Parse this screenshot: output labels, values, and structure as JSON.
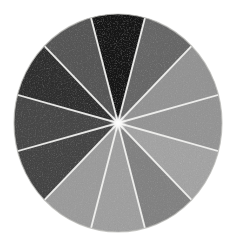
{
  "figure": {
    "background_color": "#ffffff",
    "separator_color": "#f2f2f0",
    "outline_color": "#b9b9b6",
    "texture": "hand-painted grainy gouache"
  },
  "chart_data": {
    "type": "pie",
    "xlabel": "",
    "ylabel": "",
    "legend_position": "none",
    "grid": false,
    "center_x": 118,
    "center_y": 123,
    "radius_x": 104,
    "radius_y": 109,
    "slice_count": 12,
    "equal_slices": true,
    "slice_angle_degrees": 30,
    "start_angle_degrees": -15,
    "categories": [
      "wedge-01",
      "wedge-02",
      "wedge-03",
      "wedge-04",
      "wedge-05",
      "wedge-06",
      "wedge-07",
      "wedge-08",
      "wedge-09",
      "wedge-10",
      "wedge-11",
      "wedge-12"
    ],
    "values": [
      8.3333,
      8.3333,
      8.3333,
      8.3333,
      8.3333,
      8.3333,
      8.3333,
      8.3333,
      8.3333,
      8.3333,
      8.3333,
      8.3333
    ],
    "colors": [
      "#0b0b0b",
      "#6e6e6e",
      "#8d8d8d",
      "#9a9a9a",
      "#9e9e9e",
      "#8a8a8a",
      "#9c9c9c",
      "#a4a4a4",
      "#3a3a3a",
      "#4a4a4a",
      "#242424",
      "#5c5c5c"
    ],
    "gray_levels": [
      11,
      110,
      141,
      154,
      158,
      138,
      156,
      164,
      58,
      74,
      36,
      92
    ],
    "ylim": [
      0,
      100
    ]
  },
  "slices": [
    {
      "name": "wedge-01",
      "position": "top",
      "start_angle": -15,
      "end_angle": 15,
      "color": "#0b0b0b",
      "gray": 11,
      "label": "black"
    },
    {
      "name": "wedge-02",
      "position": "upper-right-1",
      "start_angle": 15,
      "end_angle": 45,
      "color": "#6e6e6e",
      "gray": 110,
      "label": "mid gray"
    },
    {
      "name": "wedge-03",
      "position": "upper-right-2",
      "start_angle": 45,
      "end_angle": 75,
      "color": "#8d8d8d",
      "gray": 141,
      "label": "light mid gray"
    },
    {
      "name": "wedge-04",
      "position": "right",
      "start_angle": 75,
      "end_angle": 105,
      "color": "#9a9a9a",
      "gray": 154,
      "label": "light gray"
    },
    {
      "name": "wedge-05",
      "position": "lower-right-1",
      "start_angle": 105,
      "end_angle": 135,
      "color": "#9e9e9e",
      "gray": 158,
      "label": "light gray"
    },
    {
      "name": "wedge-06",
      "position": "lower-right-2",
      "start_angle": 135,
      "end_angle": 165,
      "color": "#8a8a8a",
      "gray": 138,
      "label": "light mid gray"
    },
    {
      "name": "wedge-07",
      "position": "bottom-1",
      "start_angle": 165,
      "end_angle": 195,
      "color": "#9c9c9c",
      "gray": 156,
      "label": "light gray"
    },
    {
      "name": "wedge-08",
      "position": "bottom-2",
      "start_angle": 195,
      "end_angle": 225,
      "color": "#a4a4a4",
      "gray": 164,
      "label": "lightest gray"
    },
    {
      "name": "wedge-09",
      "position": "lower-left-1",
      "start_angle": 225,
      "end_angle": 255,
      "color": "#3a3a3a",
      "gray": 58,
      "label": "dark gray"
    },
    {
      "name": "wedge-10",
      "position": "lower-left-2",
      "start_angle": 255,
      "end_angle": 285,
      "color": "#4a4a4a",
      "gray": 74,
      "label": "dark gray"
    },
    {
      "name": "wedge-11",
      "position": "upper-left-1",
      "start_angle": 285,
      "end_angle": 315,
      "color": "#242424",
      "gray": 36,
      "label": "near black"
    },
    {
      "name": "wedge-12",
      "position": "upper-left-2",
      "start_angle": 315,
      "end_angle": 345,
      "color": "#5c5c5c",
      "gray": 92,
      "label": "dark mid gray"
    }
  ]
}
